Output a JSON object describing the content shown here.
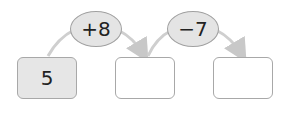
{
  "boxes": [
    {
      "value": "5",
      "filled": true
    },
    {
      "value": "",
      "filled": false
    },
    {
      "value": "",
      "filled": false
    }
  ],
  "operations": [
    {
      "label": "+8"
    },
    {
      "label": "−7"
    }
  ],
  "colors": {
    "box_fill": "#e6e6e6",
    "oval_fill": "#e4e4e4",
    "stroke": "#a8a8a8",
    "arrow": "#c8c8c8"
  }
}
